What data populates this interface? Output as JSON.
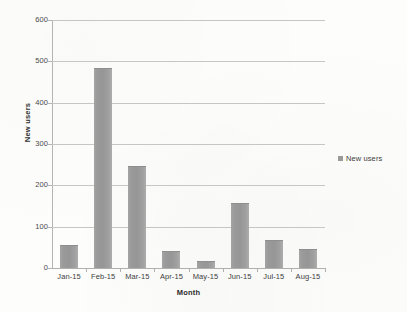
{
  "chart_data": {
    "type": "bar",
    "title": "",
    "categories": [
      "Jan-15",
      "Feb-15",
      "Mar-15",
      "Apr-15",
      "May-15",
      "Jun-15",
      "Jul-15",
      "Aug-15"
    ],
    "values": [
      55,
      483,
      248,
      42,
      18,
      157,
      68,
      47
    ],
    "series": [
      {
        "name": "New users",
        "values": [
          55,
          483,
          248,
          42,
          18,
          157,
          68,
          47
        ]
      }
    ],
    "xlabel": "Month",
    "ylabel": "New users",
    "ylim": [
      0,
      600
    ],
    "yticks": [
      0,
      100,
      200,
      300,
      400,
      500,
      600
    ],
    "ytick_labels": [
      "0",
      "100",
      "200",
      "300",
      "400",
      "500",
      "600"
    ],
    "grid": true,
    "grid_axis": "y",
    "legend": {
      "position": "right",
      "entries": [
        "New users"
      ]
    },
    "colors": {
      "bar": "#9a9a9a",
      "gridline": "#c6c6c6",
      "axis": "#b4b4b4",
      "text": "#3a3a3a",
      "background": "#fdfdfc"
    }
  }
}
